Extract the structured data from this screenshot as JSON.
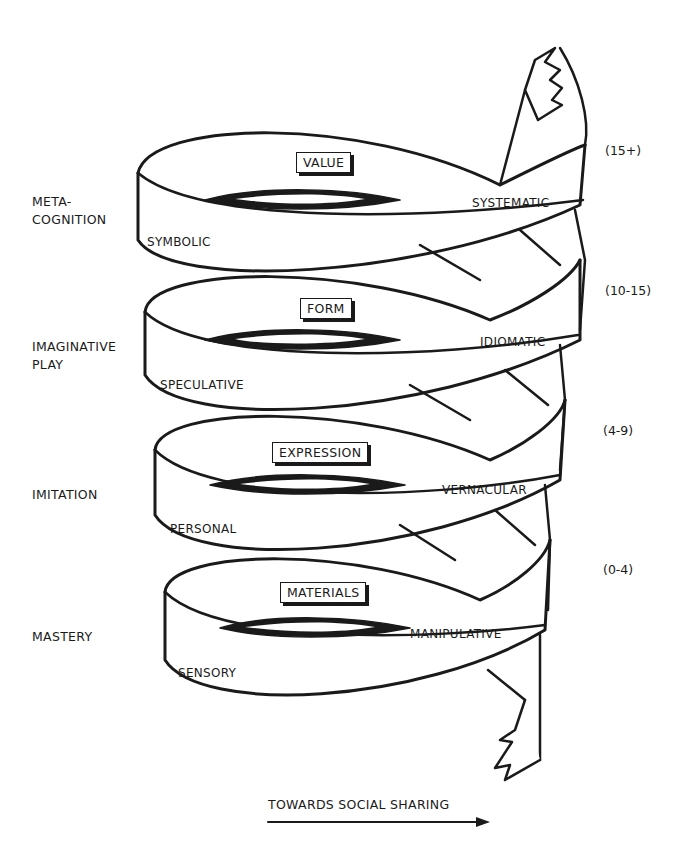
{
  "diagram": {
    "type": "spiral",
    "axis_label": "TOWARDS SOCIAL SHARING",
    "levels": [
      {
        "stage": "META-\nCOGNITION",
        "stage_line1": "META-",
        "stage_line2": "COGNITION",
        "mode": "VALUE",
        "left_band": "SYMBOLIC",
        "right_band": "SYSTEMATIC",
        "age": "(15+)"
      },
      {
        "stage": "IMAGINATIVE PLAY",
        "stage_line1": "IMAGINATIVE",
        "stage_line2": "PLAY",
        "mode": "FORM",
        "left_band": "SPECULATIVE",
        "right_band": "IDIOMATIC",
        "age": "(10-15)"
      },
      {
        "stage": "IMITATION",
        "stage_line1": "IMITATION",
        "stage_line2": "",
        "mode": "EXPRESSION",
        "left_band": "PERSONAL",
        "right_band": "VERNACULAR",
        "age": "(4-9)"
      },
      {
        "stage": "MASTERY",
        "stage_line1": "MASTERY",
        "stage_line2": "",
        "mode": "MATERIALS",
        "left_band": "SENSORY",
        "right_band": "MANIPULATIVE",
        "age": "(0-4)"
      }
    ]
  }
}
